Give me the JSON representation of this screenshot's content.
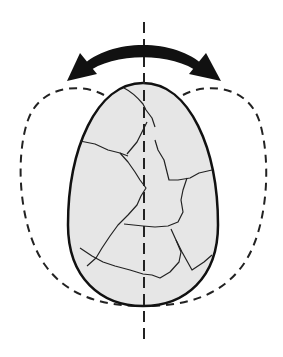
{
  "diagram": {
    "description": "Cracked egg rotating about a vertical axis",
    "elements": {
      "rotation_arrow": {
        "type": "double-headed-curved-arrow",
        "color": "#111111"
      },
      "rotation_axis": {
        "type": "dashed-vertical-line",
        "color": "#222222"
      },
      "egg": {
        "fill": "#e6e6e6",
        "stroke": "#111111",
        "cracks": "thin dark lines across shell"
      },
      "swept_outline": {
        "type": "dashed-outline",
        "color": "#222222",
        "meaning": "envelope traced by the egg as it rotates"
      }
    },
    "colors": {
      "background": "#ffffff",
      "egg_fill": "#e6e6e6",
      "ink": "#111111"
    }
  }
}
